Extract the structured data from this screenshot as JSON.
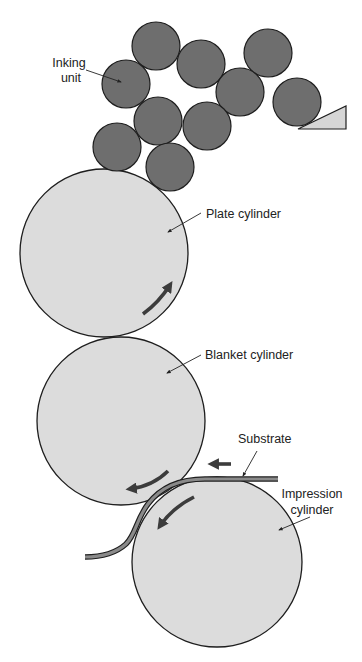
{
  "diagram": {
    "type": "offset lithography press schematic",
    "colors": {
      "background": "#ffffff",
      "roller_fill": "#6e6e6e",
      "cylinder_fill": "#dcdcdc",
      "outline": "#1e1e1e",
      "arrow": "#3c3c3c",
      "substrate_fill": "#8a8a8a",
      "blade_fill": "#d6d6d6"
    },
    "labels": {
      "inking_unit_line1": "Inking",
      "inking_unit_line2": "unit",
      "plate_cylinder": "Plate cylinder",
      "blanket_cylinder": "Blanket cylinder",
      "substrate": "Substrate",
      "impression_cylinder_line1": "Impression",
      "impression_cylinder_line2": "cylinder"
    },
    "inking_rollers": [
      {
        "cx": 156,
        "cy": 46,
        "r": 24
      },
      {
        "cx": 201,
        "cy": 64,
        "r": 24
      },
      {
        "cx": 268,
        "cy": 53,
        "r": 24
      },
      {
        "cx": 126,
        "cy": 84,
        "r": 24
      },
      {
        "cx": 240,
        "cy": 92,
        "r": 24
      },
      {
        "cx": 297,
        "cy": 102,
        "r": 24
      },
      {
        "cx": 158,
        "cy": 121,
        "r": 24
      },
      {
        "cx": 207,
        "cy": 126,
        "r": 24
      },
      {
        "cx": 117,
        "cy": 147,
        "r": 24
      },
      {
        "cx": 170,
        "cy": 167,
        "r": 24
      }
    ],
    "cylinders": [
      {
        "name": "plate",
        "cx": 104,
        "cy": 253,
        "r": 84
      },
      {
        "name": "blanket",
        "cx": 121,
        "cy": 421,
        "r": 84
      },
      {
        "name": "impression",
        "cx": 217,
        "cy": 562,
        "r": 85
      }
    ],
    "rotation_arrows": {
      "plate": "counter-clockwise (upward on right side)",
      "blanket": "clockwise (leftward at bottom)",
      "impression": "counter-clockwise (down-left at top-left)"
    },
    "substrate_direction": "right-to-left"
  }
}
